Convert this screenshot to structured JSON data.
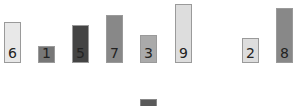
{
  "chart_data": {
    "type": "bar",
    "title": "",
    "xlabel": "",
    "ylabel": "",
    "categories": [
      "1",
      "2",
      "3",
      "4",
      "5",
      "6",
      "7",
      "8"
    ],
    "values": [
      6,
      1,
      5,
      7,
      3,
      9,
      2,
      8
    ],
    "data_labels": [
      "6",
      "1",
      "5",
      "7",
      "3",
      "9",
      "2",
      "8"
    ],
    "bar_colors": [
      "#e8e8e8",
      "#777777",
      "#444444",
      "#888888",
      "#aaaaaa",
      "#dddddd",
      "#dddddd",
      "#888888"
    ],
    "gap_before_index": 6,
    "grid": false,
    "legend": {
      "position": "bottom",
      "swatch_color": "#5a5a5a",
      "label": ""
    }
  },
  "bars": [
    {
      "label": "6",
      "left": 4,
      "top": 22,
      "height": 41,
      "color": "#e8e8e8"
    },
    {
      "label": "1",
      "left": 38,
      "top": 46,
      "height": 17,
      "color": "#777777"
    },
    {
      "label": "5",
      "left": 72,
      "top": 25,
      "height": 38,
      "color": "#444444"
    },
    {
      "label": "7",
      "left": 106,
      "top": 15,
      "height": 48,
      "color": "#888888"
    },
    {
      "label": "3",
      "left": 140,
      "top": 35,
      "height": 28,
      "color": "#aaaaaa"
    },
    {
      "label": "9",
      "left": 175,
      "top": 4,
      "height": 59,
      "color": "#dddddd"
    },
    {
      "label": "2",
      "left": 242,
      "top": 38,
      "height": 25,
      "color": "#dddddd"
    },
    {
      "label": "8",
      "left": 276,
      "top": 8,
      "height": 55,
      "color": "#888888"
    }
  ],
  "legend": {
    "text": ""
  }
}
